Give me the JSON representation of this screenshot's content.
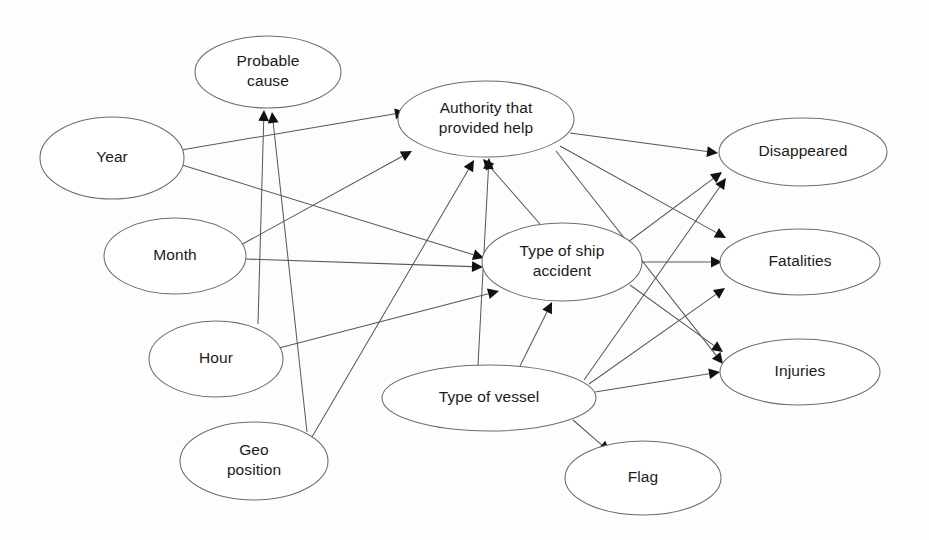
{
  "diagram": {
    "type": "bayesian-network",
    "background_color": "#fdfdfc",
    "node_stroke_color": "#6d6d6d",
    "edge_color": "#575757",
    "arrow_color": "#111111",
    "text_color": "#1b1b1b",
    "nodes": [
      {
        "id": "probable_cause",
        "label": "Probable cause",
        "lines": [
          "Probable",
          "cause"
        ],
        "cx": 268,
        "cy": 72,
        "rx": 73,
        "ry": 36
      },
      {
        "id": "year",
        "label": "Year",
        "lines": [
          "Year"
        ],
        "cx": 112,
        "cy": 158,
        "rx": 72,
        "ry": 41
      },
      {
        "id": "month",
        "label": "Month",
        "lines": [
          "Month"
        ],
        "cx": 175,
        "cy": 256,
        "rx": 71,
        "ry": 38
      },
      {
        "id": "hour",
        "label": "Hour",
        "lines": [
          "Hour"
        ],
        "cx": 216,
        "cy": 359,
        "rx": 67,
        "ry": 38
      },
      {
        "id": "geo_position",
        "label": "Geo position",
        "lines": [
          "Geo",
          "position"
        ],
        "cx": 254,
        "cy": 461,
        "rx": 74,
        "ry": 39
      },
      {
        "id": "authority",
        "label": "Authority that provided help",
        "lines": [
          "Authority that",
          "provided help"
        ],
        "cx": 486,
        "cy": 119,
        "rx": 88,
        "ry": 38
      },
      {
        "id": "ship_accident",
        "label": "Type of ship accident",
        "lines": [
          "Type of ship",
          "accident"
        ],
        "cx": 562,
        "cy": 262,
        "rx": 80,
        "ry": 39
      },
      {
        "id": "type_of_vessel",
        "label": "Type of vessel",
        "lines": [
          "Type of vessel"
        ],
        "cx": 489,
        "cy": 398,
        "rx": 107,
        "ry": 33
      },
      {
        "id": "flag",
        "label": "Flag",
        "lines": [
          "Flag"
        ],
        "cx": 643,
        "cy": 478,
        "rx": 78,
        "ry": 37
      },
      {
        "id": "disappeared",
        "label": "Disappeared",
        "lines": [
          "Disappeared"
        ],
        "cx": 803,
        "cy": 152,
        "rx": 84,
        "ry": 34
      },
      {
        "id": "fatalities",
        "label": "Fatalities",
        "lines": [
          "Fatalities"
        ],
        "cx": 800,
        "cy": 262,
        "rx": 80,
        "ry": 33
      },
      {
        "id": "injuries",
        "label": "Injuries",
        "lines": [
          "Injuries"
        ],
        "cx": 800,
        "cy": 372,
        "rx": 80,
        "ry": 33
      }
    ],
    "edges": [
      {
        "from": "year",
        "to": "authority",
        "x1": 181,
        "y1": 150,
        "x2": 406,
        "y2": 112
      },
      {
        "from": "year",
        "to": "ship_accident",
        "x1": 182,
        "y1": 165,
        "x2": 484,
        "y2": 258
      },
      {
        "from": "month",
        "to": "authority",
        "x1": 239,
        "y1": 246,
        "x2": 412,
        "y2": 151
      },
      {
        "from": "month",
        "to": "ship_accident",
        "x1": 245,
        "y1": 259,
        "x2": 483,
        "y2": 267
      },
      {
        "from": "hour",
        "to": "probable_cause",
        "x1": 258,
        "y1": 324,
        "x2": 264,
        "y2": 110
      },
      {
        "from": "hour",
        "to": "ship_accident",
        "x1": 279,
        "y1": 348,
        "x2": 499,
        "y2": 291
      },
      {
        "from": "geo_position",
        "to": "probable_cause",
        "x1": 307,
        "y1": 432,
        "x2": 272,
        "y2": 112
      },
      {
        "from": "geo_position",
        "to": "authority",
        "x1": 312,
        "y1": 437,
        "x2": 474,
        "y2": 160
      },
      {
        "from": "ship_accident",
        "to": "authority",
        "x1": 540,
        "y1": 224,
        "x2": 483,
        "y2": 159
      },
      {
        "from": "ship_accident",
        "to": "disappeared",
        "x1": 628,
        "y1": 242,
        "x2": 722,
        "y2": 172
      },
      {
        "from": "ship_accident",
        "to": "fatalities",
        "x1": 641,
        "y1": 262,
        "x2": 722,
        "y2": 262
      },
      {
        "from": "ship_accident",
        "to": "injuries",
        "x1": 630,
        "y1": 285,
        "x2": 723,
        "y2": 352
      },
      {
        "from": "authority",
        "to": "disappeared",
        "x1": 570,
        "y1": 133,
        "x2": 718,
        "y2": 153
      },
      {
        "from": "authority",
        "to": "fatalities",
        "x1": 560,
        "y1": 146,
        "x2": 726,
        "y2": 238
      },
      {
        "from": "authority",
        "to": "injuries",
        "x1": 556,
        "y1": 151,
        "x2": 723,
        "y2": 364
      },
      {
        "from": "type_of_vessel",
        "to": "authority",
        "x1": 478,
        "y1": 365,
        "x2": 489,
        "y2": 158
      },
      {
        "from": "type_of_vessel",
        "to": "ship_accident",
        "x1": 519,
        "y1": 368,
        "x2": 552,
        "y2": 302
      },
      {
        "from": "type_of_vessel",
        "to": "flag",
        "x1": 573,
        "y1": 420,
        "x2": 610,
        "y2": 452
      },
      {
        "from": "type_of_vessel",
        "to": "disappeared",
        "x1": 584,
        "y1": 380,
        "x2": 726,
        "y2": 178
      },
      {
        "from": "type_of_vessel",
        "to": "fatalities",
        "x1": 589,
        "y1": 384,
        "x2": 725,
        "y2": 288
      },
      {
        "from": "type_of_vessel",
        "to": "injuries",
        "x1": 595,
        "y1": 392,
        "x2": 720,
        "y2": 372
      }
    ]
  }
}
